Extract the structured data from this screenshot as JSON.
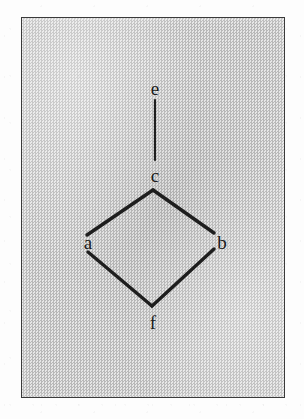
{
  "figure": {
    "kind": "hasse-diagram",
    "panel": {
      "fill_color": "#cfcfcf",
      "border_color": "#3a3a3a",
      "x": 21,
      "y": 17,
      "width": 264,
      "height": 381
    },
    "stroke_color": "#1e1e1e",
    "nodes": [
      {
        "id": "e",
        "label": "e",
        "x": 155,
        "y": 88,
        "label_x": 155,
        "label_y": 88
      },
      {
        "id": "c",
        "label": "c",
        "x": 155,
        "y": 175,
        "label_x": 155,
        "label_y": 175
      },
      {
        "id": "a",
        "label": "a",
        "x": 85,
        "y": 237,
        "label_x": 88,
        "label_y": 242
      },
      {
        "id": "b",
        "label": "b",
        "x": 215,
        "y": 238,
        "label_x": 222,
        "label_y": 243
      },
      {
        "id": "f",
        "label": "f",
        "x": 152,
        "y": 307,
        "label_x": 153,
        "label_y": 322
      }
    ],
    "edges": [
      {
        "from": "e",
        "to": "c",
        "x1": 155,
        "y1": 100,
        "x2": 155,
        "y2": 160,
        "width": 2.2
      },
      {
        "from": "c",
        "to": "a",
        "x1": 153,
        "y1": 190,
        "x2": 87,
        "y2": 235,
        "width": 3.4
      },
      {
        "from": "c",
        "to": "b",
        "x1": 153,
        "y1": 190,
        "x2": 214,
        "y2": 233,
        "width": 3.4
      },
      {
        "from": "a",
        "to": "f",
        "x1": 88,
        "y1": 252,
        "x2": 152,
        "y2": 306,
        "width": 3.4
      },
      {
        "from": "b",
        "to": "f",
        "x1": 214,
        "y1": 249,
        "x2": 152,
        "y2": 306,
        "width": 3.4
      }
    ]
  }
}
